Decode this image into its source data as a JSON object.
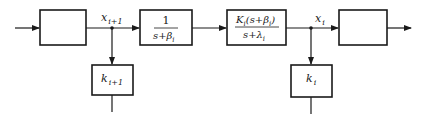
{
  "diagram": {
    "type": "block-diagram",
    "signals": {
      "left": {
        "main": "x",
        "sub": "i+1"
      },
      "right": {
        "main": "x",
        "sub": "i"
      }
    },
    "blocks": [
      {
        "id": "block-1",
        "content": ""
      },
      {
        "id": "block-2",
        "numerator": "1",
        "denominator": {
          "pre": "s+",
          "sym": "β",
          "sub": "i"
        }
      },
      {
        "id": "block-3",
        "numerator": {
          "K": "K",
          "Ksub": "i",
          "open": "(s+",
          "sym": "β",
          "sub": "i",
          "close": ")"
        },
        "denominator": {
          "pre": "s+",
          "sym": "λ",
          "sub": "i"
        }
      },
      {
        "id": "block-4",
        "content": ""
      }
    ],
    "feedback_blocks": [
      {
        "id": "gain-left",
        "main": "k",
        "sub": "i+1"
      },
      {
        "id": "gain-right",
        "main": "k",
        "sub": "i"
      }
    ]
  }
}
